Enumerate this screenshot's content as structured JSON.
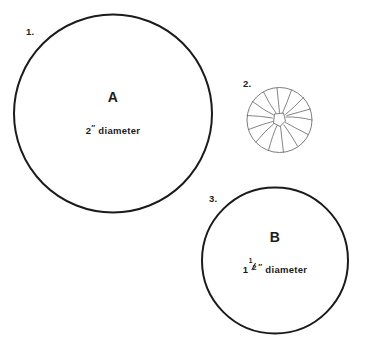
{
  "page": {
    "background_color": "#ffffff",
    "width": 369,
    "height": 351
  },
  "style": {
    "outline_color": "#1b1b1b",
    "gather_line_color": "#6f6f6f",
    "text_color": "#1b1b1b"
  },
  "figures": [
    {
      "id": "figure-1",
      "number_label": "1.",
      "letter": "A",
      "caption": "2″ diameter",
      "caption_whole": "2",
      "caption_inch": "″",
      "caption_unit_word": "diameter",
      "shape": "circle",
      "cx": 113,
      "cy": 113.5,
      "r": 99,
      "stroke_width": 2,
      "number_label_x": 26,
      "number_label_y": 27,
      "letter_y": 90,
      "caption_y": 124
    },
    {
      "id": "figure-2",
      "number_label": "2.",
      "letter": "",
      "caption": "",
      "shape": "gathered-circle",
      "cx": 279.5,
      "cy": 120,
      "r": 32.5,
      "stroke_width": 0.9,
      "gather_spokes": 14,
      "center_opening_r": 6,
      "number_label_x": 243,
      "number_label_y": 79
    },
    {
      "id": "figure-3",
      "number_label": "3.",
      "letter": "B",
      "caption": "1 ½″ diameter",
      "caption_whole": "1",
      "caption_frac_num": "1",
      "caption_frac_den": "2",
      "caption_inch": "″",
      "caption_unit_word": "diameter",
      "shape": "circle",
      "cx": 275,
      "cy": 260.5,
      "r": 73,
      "stroke_width": 2,
      "number_label_x": 209,
      "number_label_y": 194,
      "letter_y": 230,
      "caption_y": 262
    }
  ]
}
